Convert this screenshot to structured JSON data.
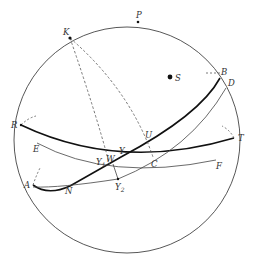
{
  "diagram": {
    "colors": {
      "stroke": "#444444",
      "thick": "#111111",
      "dashed": "#555555",
      "background": "#ffffff"
    },
    "labels": {
      "K": "K",
      "P": "P",
      "S": "S",
      "B": "B",
      "D": "D",
      "R": "R",
      "T": "T",
      "E": "E",
      "F": "F",
      "A": "A",
      "N": "N",
      "U": "U",
      "C": "C",
      "W": "W",
      "aries": "Υ",
      "aries1": "Υ",
      "aries1_sub": "1",
      "aries2": "Υ",
      "aries2_sub": "2"
    }
  }
}
